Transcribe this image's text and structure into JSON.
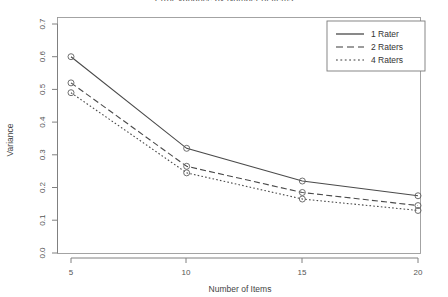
{
  "chart_data": {
    "type": "line",
    "title": "Error Variance by Number of Items",
    "xlabel": "Number of Items",
    "ylabel": "Variance",
    "x": [
      5,
      10,
      15,
      20
    ],
    "categories": [
      "5",
      "10",
      "15",
      "20"
    ],
    "series": [
      {
        "name": "1 Rater",
        "values": [
          0.6,
          0.32,
          0.22,
          0.175
        ],
        "style": "solid"
      },
      {
        "name": "2 Raters",
        "values": [
          0.52,
          0.265,
          0.185,
          0.145
        ],
        "style": "dashed"
      },
      {
        "name": "4 Raters",
        "values": [
          0.49,
          0.245,
          0.165,
          0.13
        ],
        "style": "dotted"
      }
    ],
    "xlim": [
      3.0,
      22.0
    ],
    "ylim": [
      0.0,
      0.7
    ],
    "xticks": [
      5,
      10,
      15,
      20
    ],
    "xticklabels": [
      "5",
      "10",
      "15",
      "20"
    ],
    "yticks": [
      0.0,
      0.1,
      0.2,
      0.3,
      0.4,
      0.5,
      0.6,
      0.7
    ],
    "yticklabels": [
      "0.0",
      "0.1",
      "0.2",
      "0.3",
      "0.4",
      "0.5",
      "0.6",
      "0.7"
    ],
    "grid": false,
    "legend_position": "top-right",
    "marker": "circle",
    "colors": {
      "line": "#4a4a4a",
      "marker": "#606060",
      "axis": "#808080",
      "text": "#555555",
      "background": "#ffffff"
    }
  },
  "axis": {
    "y_title": "Variance",
    "x_title": "Number of Items",
    "y_labels": [
      "0.0",
      "0.1",
      "0.2",
      "0.3",
      "0.4",
      "0.5",
      "0.6",
      "0.7"
    ],
    "x_labels": [
      "5",
      "10",
      "15",
      "20"
    ]
  },
  "legend": {
    "entries": [
      {
        "label": "1 Rater"
      },
      {
        "label": "2 Raters"
      },
      {
        "label": "4 Raters"
      }
    ]
  }
}
